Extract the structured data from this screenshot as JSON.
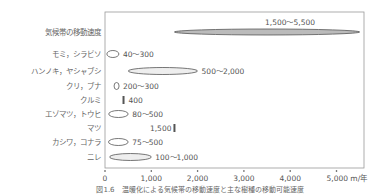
{
  "chart_data": {
    "type": "range",
    "title": "",
    "caption": "図1.6　温暖化による気候帯の移動速度と主な樹種の移動可能速度",
    "xlabel": "m/年",
    "ylabel": "",
    "xlim": [
      0,
      5500
    ],
    "x_ticks": [
      "0",
      "1,000",
      "2,000",
      "3,000",
      "4,000",
      "5,000 m/年"
    ],
    "grid": false,
    "rows": [
      {
        "label": "気候帯の移動速度",
        "min": 1500,
        "max": 5500,
        "value_label": "1,500～5,500",
        "shape": "ellipse",
        "fill": "#bbbbbb"
      },
      {
        "label": "モミ，シラビソ",
        "min": 40,
        "max": 300,
        "value_label": "40～300",
        "shape": "ellipse",
        "fill": "#ffffff"
      },
      {
        "label": "ハンノキ，ヤシャブシ",
        "min": 500,
        "max": 2000,
        "value_label": "500～2,000",
        "shape": "ellipse",
        "fill": "#eeeeee"
      },
      {
        "label": "クリ，ブナ",
        "min": 200,
        "max": 300,
        "value_label": "200～300",
        "shape": "ellipse",
        "fill": "#ffffff"
      },
      {
        "label": "クルミ",
        "min": 400,
        "max": 400,
        "value_label": "400",
        "shape": "bar",
        "fill": "#555555"
      },
      {
        "label": "エゾマツ，トウヒ",
        "min": 80,
        "max": 500,
        "value_label": "80～500",
        "shape": "ellipse",
        "fill": "#ffffff"
      },
      {
        "label": "マツ",
        "min": 1500,
        "max": 1500,
        "value_label": "1,500",
        "shape": "bar",
        "fill": "#555555",
        "label_left": true
      },
      {
        "label": "カシワ，コナラ",
        "min": 75,
        "max": 500,
        "value_label": "75～500",
        "shape": "ellipse",
        "fill": "#ffffff"
      },
      {
        "label": "ニレ",
        "min": 100,
        "max": 1000,
        "value_label": "100～1,000",
        "shape": "ellipse",
        "fill": "#eeeeee"
      }
    ]
  },
  "colors": {
    "axis": "#888888",
    "text": "#666666"
  }
}
